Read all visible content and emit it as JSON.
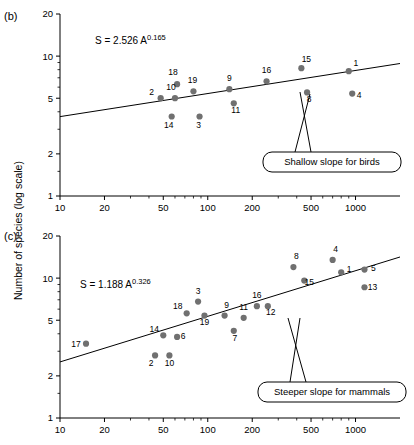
{
  "figure": {
    "ylabel": "Number of species (log scale)",
    "panel_b_label": "(b)",
    "panel_c_label": "(c)"
  },
  "chart_data": [
    {
      "type": "scatter",
      "panel": "(b)",
      "title": "",
      "annotation_equation": "S = 2.526 A",
      "annotation_exponent": "0.165",
      "callout": "Shallow slope for birds",
      "xlabel": "",
      "ylabel": "Number of species (log scale)",
      "xscale": "log",
      "yscale": "log",
      "xlim": [
        10,
        2000
      ],
      "ylim": [
        1,
        20
      ],
      "xticks": [
        10,
        20,
        50,
        100,
        200,
        500,
        1000
      ],
      "yticks": [
        1,
        2,
        5,
        10,
        20
      ],
      "grid": false,
      "fit_line": {
        "intercept_S_at_A1": 2.526,
        "slope": 0.165
      },
      "points": [
        {
          "label": "2",
          "x": 48,
          "y": 5.0
        },
        {
          "label": "18",
          "x": 62,
          "y": 6.3
        },
        {
          "label": "10",
          "x": 60,
          "y": 5.0
        },
        {
          "label": "14",
          "x": 57,
          "y": 3.7
        },
        {
          "label": "19",
          "x": 80,
          "y": 5.6
        },
        {
          "label": "3",
          "x": 88,
          "y": 3.7
        },
        {
          "label": "9",
          "x": 140,
          "y": 5.8
        },
        {
          "label": "11",
          "x": 150,
          "y": 4.6
        },
        {
          "label": "16",
          "x": 250,
          "y": 6.6
        },
        {
          "label": "15",
          "x": 430,
          "y": 8.2
        },
        {
          "label": "8",
          "x": 470,
          "y": 5.5
        },
        {
          "label": "1",
          "x": 900,
          "y": 7.8
        },
        {
          "label": "4",
          "x": 950,
          "y": 5.4
        }
      ]
    },
    {
      "type": "scatter",
      "panel": "(c)",
      "title": "",
      "annotation_equation": "S = 1.188 A",
      "annotation_exponent": "0.326",
      "callout": "Steeper slope for mammals",
      "xlabel": "",
      "ylabel": "Number of species (log scale)",
      "xscale": "log",
      "yscale": "log",
      "xlim": [
        10,
        2000
      ],
      "ylim": [
        1,
        20
      ],
      "xticks": [
        10,
        20,
        50,
        100,
        200,
        500,
        1000
      ],
      "yticks": [
        1,
        2,
        5,
        10,
        20
      ],
      "grid": false,
      "fit_line": {
        "intercept_S_at_A1": 1.188,
        "slope": 0.326
      },
      "points": [
        {
          "label": "17",
          "x": 15,
          "y": 3.4
        },
        {
          "label": "2",
          "x": 44,
          "y": 2.8
        },
        {
          "label": "14",
          "x": 50,
          "y": 3.9
        },
        {
          "label": "10",
          "x": 55,
          "y": 2.8
        },
        {
          "label": "6",
          "x": 62,
          "y": 3.8
        },
        {
          "label": "18",
          "x": 72,
          "y": 5.6
        },
        {
          "label": "3",
          "x": 86,
          "y": 6.8
        },
        {
          "label": "19",
          "x": 95,
          "y": 5.4
        },
        {
          "label": "9",
          "x": 130,
          "y": 5.4
        },
        {
          "label": "7",
          "x": 150,
          "y": 4.2
        },
        {
          "label": "11",
          "x": 175,
          "y": 5.2
        },
        {
          "label": "16",
          "x": 215,
          "y": 6.3
        },
        {
          "label": "12",
          "x": 255,
          "y": 6.3
        },
        {
          "label": "8",
          "x": 380,
          "y": 12.0
        },
        {
          "label": "15",
          "x": 450,
          "y": 9.6
        },
        {
          "label": "4",
          "x": 700,
          "y": 13.5
        },
        {
          "label": "1",
          "x": 800,
          "y": 11.0
        },
        {
          "label": "5",
          "x": 1150,
          "y": 11.5
        },
        {
          "label": "13",
          "x": 1150,
          "y": 8.6
        }
      ]
    }
  ],
  "style": {
    "point_color": "#707070",
    "axis_color": "#000000",
    "line_color": "#000000"
  }
}
